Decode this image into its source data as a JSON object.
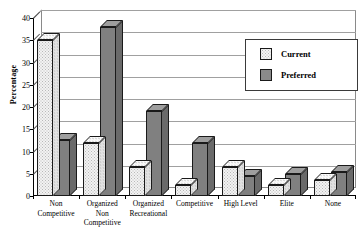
{
  "chart_data": {
    "type": "bar",
    "title": "",
    "xlabel": "",
    "ylabel": "Percentage",
    "ylim": [
      0,
      40
    ],
    "yticks": [
      0,
      5,
      10,
      15,
      20,
      25,
      30,
      35,
      40
    ],
    "grid": true,
    "legend_position": "top-right",
    "style": "3d-grouped-bars",
    "categories": [
      "Non\nCompetitive",
      "Organized\nNon\nCompetitive",
      "Organized\nRecreational",
      "Competitive",
      "High Level",
      "Elite",
      "None"
    ],
    "series": [
      {
        "name": "Current",
        "color": "#f2f2f2",
        "pattern": "dotted",
        "values": [
          35,
          12,
          6.5,
          2.5,
          6.5,
          2.5,
          3.5
        ]
      },
      {
        "name": "Preferred",
        "color": "#808080",
        "pattern": "solid",
        "values": [
          12.5,
          38,
          19,
          12,
          4.5,
          5,
          5.5
        ]
      }
    ]
  },
  "legend": {
    "items": [
      {
        "label": "Current"
      },
      {
        "label": "Preferred"
      }
    ]
  }
}
